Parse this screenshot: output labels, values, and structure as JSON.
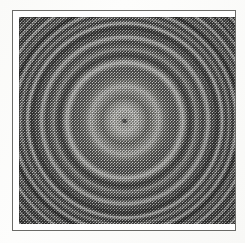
{
  "figure": {
    "kind": "halftone-scanned-image",
    "caption": "",
    "label": ""
  },
  "page": {
    "background_color": "#fdfdfc",
    "margin_color": "#ffffff"
  },
  "frame": {
    "name": "figure-frame",
    "border_color": "#6b6b68",
    "border_width_px": 1,
    "left_px": 12,
    "top_px": 10,
    "width_px": 224,
    "height_px": 221,
    "inner_mat_color": "#ffffff"
  },
  "plate": {
    "name": "halftone-plate",
    "left_px": 19,
    "top_px": 17,
    "width_px": 216,
    "height_px": 207,
    "base_gray": "#8d8d8a",
    "darkest_gray": "#2a2a28",
    "lightest_gray": "#e6e6e2",
    "screen_type": "ordered-dither-halftone",
    "screen_pitch_px": 3
  },
  "pattern": {
    "type": "zone-plate",
    "center_x_pct": 49,
    "center_y_pct": 50,
    "center_x_px": 125,
    "center_y_px": 120,
    "ring_count_visible": 9,
    "frequency_profile": "increases-radially-outward",
    "center_dot": {
      "name": "center-nucleus-dot",
      "color": "#3a3a38",
      "width_px": 5,
      "height_px": 4
    },
    "ring_bands": [
      {
        "zone": "inner",
        "period_px": 23,
        "start_radius_px": 0,
        "contrast": 0.6
      },
      {
        "zone": "mid",
        "period_px": 13,
        "start_radius_px": 34,
        "contrast": 0.52
      },
      {
        "zone": "outer",
        "period_px": 7.2,
        "start_radius_px": 72,
        "contrast": 0.5
      },
      {
        "zone": "edge",
        "period_px": 4.4,
        "start_radius_px": 110,
        "contrast": 0.46
      }
    ]
  },
  "colors": {
    "frame_rule": "#6b6b68",
    "plate_mid_gray": "#8d8d8a",
    "center_dot": "#3a3a38",
    "paper_white": "#fdfdfc"
  }
}
